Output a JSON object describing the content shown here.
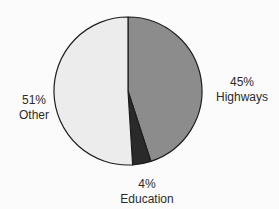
{
  "chart_data": {
    "type": "pie",
    "title": "",
    "start_angle_deg": 0,
    "direction": "clockwise",
    "center": [
      128,
      91
    ],
    "radius": 74,
    "legend": "none",
    "slices": [
      {
        "label": "Highways",
        "value": 45,
        "pct_label": "45%",
        "color": "#8c8c8c",
        "label_pos": [
          242,
          75
        ]
      },
      {
        "label": "Education",
        "value": 4,
        "pct_label": "4%",
        "color": "#2a2a2a",
        "label_pos": [
          147,
          177
        ]
      },
      {
        "label": "Other",
        "value": 51,
        "pct_label": "51%",
        "color": "#ececec",
        "label_pos": [
          34,
          93
        ]
      }
    ],
    "categories": [
      "Highways",
      "Education",
      "Other"
    ],
    "values": [
      45,
      4,
      51
    ]
  },
  "labels": {
    "highways": {
      "pct": "45%",
      "name": "Highways"
    },
    "education": {
      "pct": "4%",
      "name": "Education"
    },
    "other": {
      "pct": "51%",
      "name": "Other"
    }
  }
}
